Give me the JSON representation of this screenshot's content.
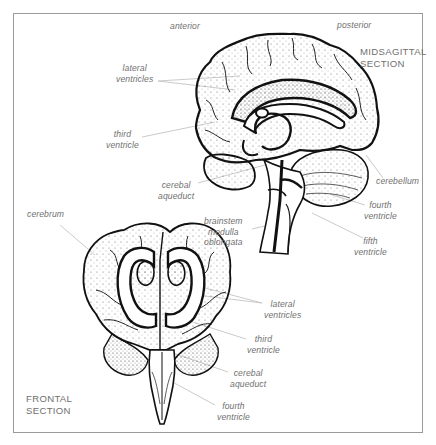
{
  "diagram": {
    "colors": {
      "frame": "#9a9a9a",
      "ink": "#111111",
      "label_text": "#6f6f6f",
      "leader_line": "#c4c4c4",
      "background": "#ffffff"
    },
    "midsagittal": {
      "title_lines": [
        "MIDSAGITTAL",
        "SECTION"
      ],
      "orientation": {
        "anterior": "anterior",
        "posterior": "posterior"
      },
      "labels": [
        {
          "id": "lateral-ventricles",
          "lines": [
            "lateral",
            "ventricles"
          ]
        },
        {
          "id": "third-ventricle",
          "lines": [
            "third",
            "ventricle"
          ]
        },
        {
          "id": "cerebal-aqueduct",
          "lines": [
            "cerebal",
            "aqueduct"
          ]
        },
        {
          "id": "brainstem-medulla-oblongata",
          "lines": [
            "brainstem",
            "medulla",
            "oblongata"
          ]
        },
        {
          "id": "cerebellum",
          "lines": [
            "cerebellum"
          ]
        },
        {
          "id": "fourth-ventricle",
          "lines": [
            "fourth",
            "ventricle"
          ]
        },
        {
          "id": "fifth-ventricle",
          "lines": [
            "fifth",
            "ventricle"
          ]
        }
      ]
    },
    "frontal": {
      "title_lines": [
        "FRONTAL",
        "SECTION"
      ],
      "labels": [
        {
          "id": "cerebrum",
          "lines": [
            "cerebrum"
          ]
        },
        {
          "id": "lateral-ventricles",
          "lines": [
            "lateral",
            "ventricles"
          ]
        },
        {
          "id": "third-ventricle",
          "lines": [
            "third",
            "ventricle"
          ]
        },
        {
          "id": "cerebal-aqueduct",
          "lines": [
            "cerebal",
            "aqueduct"
          ]
        },
        {
          "id": "fourth-ventricle",
          "lines": [
            "fourth",
            "ventricle"
          ]
        }
      ]
    }
  }
}
